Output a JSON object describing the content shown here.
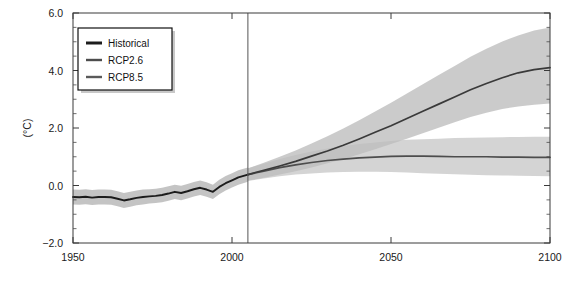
{
  "chart_data": {
    "type": "line",
    "title": "",
    "xlabel": "",
    "ylabel": "(°C)",
    "xlim": [
      1950,
      2100
    ],
    "ylim": [
      -2.0,
      6.0
    ],
    "xticks": [
      1950,
      2000,
      2050,
      2100
    ],
    "xtick_labels": [
      "1950",
      "2000",
      "2050",
      "2100"
    ],
    "yticks": [
      -2.0,
      0.0,
      2.0,
      4.0,
      6.0
    ],
    "ytick_labels": [
      "-2.0",
      "0.0",
      "2.0",
      "4.0",
      "6.0"
    ],
    "ytick_minor_step": 0.5,
    "grid": false,
    "legend_position": "upper-left",
    "reference_line_x": 2005,
    "annotations": [
      {
        "name": "historical-projection-divider",
        "x": 2005,
        "label": ""
      }
    ],
    "series": [
      {
        "name": "Historical",
        "color": "#1c1c1c",
        "band_color": "#b4b4b4",
        "x": [
          1950,
          1952,
          1954,
          1956,
          1958,
          1960,
          1962,
          1964,
          1966,
          1968,
          1970,
          1972,
          1974,
          1976,
          1978,
          1980,
          1982,
          1984,
          1986,
          1988,
          1990,
          1992,
          1994,
          1996,
          1998,
          2000,
          2002,
          2005
        ],
        "values": [
          -0.4,
          -0.41,
          -0.39,
          -0.42,
          -0.4,
          -0.4,
          -0.41,
          -0.46,
          -0.52,
          -0.48,
          -0.43,
          -0.4,
          -0.38,
          -0.36,
          -0.33,
          -0.28,
          -0.22,
          -0.26,
          -0.2,
          -0.13,
          -0.08,
          -0.14,
          -0.22,
          -0.05,
          0.08,
          0.18,
          0.28,
          0.38
        ],
        "band_low": [
          -0.66,
          -0.67,
          -0.65,
          -0.68,
          -0.66,
          -0.66,
          -0.67,
          -0.72,
          -0.78,
          -0.74,
          -0.69,
          -0.66,
          -0.63,
          -0.61,
          -0.58,
          -0.53,
          -0.47,
          -0.51,
          -0.45,
          -0.38,
          -0.33,
          -0.39,
          -0.47,
          -0.3,
          -0.17,
          -0.07,
          0.03,
          0.13
        ],
        "band_high": [
          -0.14,
          -0.15,
          -0.13,
          -0.16,
          -0.14,
          -0.14,
          -0.15,
          -0.2,
          -0.26,
          -0.22,
          -0.17,
          -0.14,
          -0.13,
          -0.11,
          -0.08,
          -0.03,
          0.03,
          -0.01,
          0.05,
          0.12,
          0.17,
          0.11,
          0.03,
          0.2,
          0.33,
          0.43,
          0.53,
          0.63
        ]
      },
      {
        "name": "RCP2.6",
        "color": "#4d4d4d",
        "band_color": "#c8c8c8",
        "x": [
          2005,
          2010,
          2015,
          2020,
          2025,
          2030,
          2035,
          2040,
          2045,
          2050,
          2055,
          2060,
          2065,
          2070,
          2075,
          2080,
          2085,
          2090,
          2095,
          2100
        ],
        "values": [
          0.38,
          0.5,
          0.62,
          0.72,
          0.8,
          0.87,
          0.92,
          0.96,
          0.99,
          1.01,
          1.02,
          1.02,
          1.01,
          1.0,
          1.0,
          1.0,
          0.99,
          0.99,
          0.98,
          0.98
        ],
        "band_low": [
          0.16,
          0.24,
          0.32,
          0.38,
          0.42,
          0.45,
          0.47,
          0.48,
          0.48,
          0.47,
          0.45,
          0.43,
          0.41,
          0.39,
          0.37,
          0.36,
          0.35,
          0.34,
          0.33,
          0.32
        ],
        "band_high": [
          0.6,
          0.76,
          0.92,
          1.06,
          1.18,
          1.29,
          1.37,
          1.44,
          1.5,
          1.55,
          1.59,
          1.61,
          1.63,
          1.65,
          1.66,
          1.67,
          1.68,
          1.69,
          1.7,
          1.7
        ]
      },
      {
        "name": "RCP8.5",
        "color": "#3a3a3a",
        "band_color": "#bdbdbd",
        "x": [
          2005,
          2010,
          2015,
          2020,
          2025,
          2030,
          2035,
          2040,
          2045,
          2050,
          2055,
          2060,
          2065,
          2070,
          2075,
          2080,
          2085,
          2090,
          2095,
          2100
        ],
        "values": [
          0.38,
          0.53,
          0.68,
          0.84,
          1.02,
          1.2,
          1.4,
          1.62,
          1.85,
          2.08,
          2.33,
          2.58,
          2.83,
          3.08,
          3.33,
          3.55,
          3.75,
          3.92,
          4.03,
          4.1
        ],
        "band_low": [
          0.17,
          0.27,
          0.38,
          0.5,
          0.63,
          0.77,
          0.92,
          1.09,
          1.26,
          1.44,
          1.63,
          1.82,
          2.01,
          2.2,
          2.38,
          2.53,
          2.66,
          2.75,
          2.81,
          2.85
        ],
        "band_high": [
          0.59,
          0.79,
          1.0,
          1.22,
          1.46,
          1.71,
          1.98,
          2.27,
          2.57,
          2.88,
          3.2,
          3.52,
          3.84,
          4.16,
          4.48,
          4.76,
          5.01,
          5.22,
          5.39,
          5.5
        ]
      }
    ]
  },
  "legend": {
    "items": [
      {
        "label": "Historical",
        "color": "#1c1c1c"
      },
      {
        "label": "RCP2.6",
        "color": "#4d4d4d"
      },
      {
        "label": "RCP8.5",
        "color": "#5a5a5a"
      }
    ]
  }
}
